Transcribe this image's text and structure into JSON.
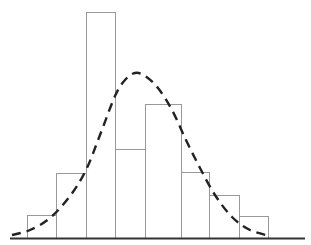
{
  "chart_data": {
    "type": "bar",
    "subtype": "histogram-with-density-curve",
    "title": "",
    "xlabel": "",
    "ylabel": "",
    "categories": [
      "bin1",
      "bin2",
      "bin3",
      "bin4",
      "bin5",
      "bin6",
      "bin7",
      "bin8"
    ],
    "values": [
      1,
      3,
      10,
      4,
      6,
      3,
      2,
      1
    ],
    "bin_edges_px": [
      27,
      56,
      86,
      115,
      145,
      181,
      209,
      239,
      268
    ],
    "bar_tops_px": [
      215,
      173,
      12,
      149,
      104,
      172,
      195,
      216
    ],
    "baseline_px": 238,
    "axis_x_px": [
      10,
      305
    ],
    "series": [
      {
        "name": "histogram",
        "values": [
          1,
          3,
          10,
          4,
          6,
          3,
          2,
          1
        ]
      },
      {
        "name": "normal-curve",
        "style": "dashed",
        "points_px": [
          [
            12,
            235
          ],
          [
            30,
            230
          ],
          [
            50,
            218
          ],
          [
            70,
            196
          ],
          [
            86,
            170
          ],
          [
            100,
            135
          ],
          [
            115,
            96
          ],
          [
            125,
            80
          ],
          [
            135,
            73
          ],
          [
            145,
            76
          ],
          [
            158,
            88
          ],
          [
            172,
            110
          ],
          [
            186,
            140
          ],
          [
            200,
            168
          ],
          [
            215,
            195
          ],
          [
            232,
            217
          ],
          [
            250,
            230
          ],
          [
            270,
            236
          ]
        ]
      }
    ],
    "grid": false,
    "legend": "none",
    "colors": {
      "bar_edge": "#999999",
      "bar_fill": "#ffffff",
      "curve": "#222222",
      "axis": "#333333"
    }
  }
}
